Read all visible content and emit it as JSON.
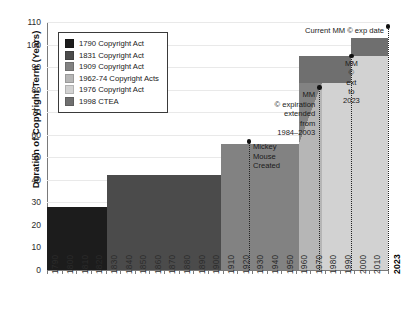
{
  "chart_data": {
    "type": "bar",
    "title": "",
    "xlabel": "",
    "ylabel": "Duration of Copyright Term (Years)",
    "ylim": [
      0,
      110
    ],
    "xlim": [
      1790,
      2023
    ],
    "grid": true,
    "legend_position": "upper-left",
    "ytick_labels": [
      "0",
      "10",
      "20",
      "30",
      "40",
      "50",
      "60",
      "70",
      "80",
      "90",
      "100",
      "110"
    ],
    "ytick_values": [
      0,
      10,
      20,
      30,
      40,
      50,
      60,
      70,
      80,
      90,
      100,
      110
    ],
    "xtick_labels": [
      "1790",
      "1800",
      "1810",
      "1820",
      "1830",
      "1840",
      "1850",
      "1860",
      "1870",
      "1880",
      "1890",
      "1900",
      "1910",
      "1920",
      "1930",
      "1940",
      "1950",
      "1960",
      "1970",
      "1980",
      "1990",
      "2000",
      "2010",
      "2023"
    ],
    "xtick_values": [
      1790,
      1800,
      1810,
      1820,
      1830,
      1840,
      1850,
      1860,
      1870,
      1880,
      1890,
      1900,
      1910,
      1920,
      1930,
      1940,
      1950,
      1960,
      1970,
      1980,
      1990,
      2000,
      2010,
      2023
    ],
    "series": [
      {
        "name": "1790 Copyright Act",
        "color": "#1c1c1c",
        "x_start": 1790,
        "x_end": 1831,
        "value": 28
      },
      {
        "name": "1831 Copyright Act",
        "color": "#4b4b4b",
        "x_start": 1831,
        "x_end": 1909,
        "value": 42
      },
      {
        "name": "1909 Copyright Act",
        "color": "#828282",
        "x_start": 1909,
        "x_end": 1962,
        "value": 56
      },
      {
        "name": "1962-74 Copyright Acts",
        "color": "#b6b6b6",
        "x_start": 1962,
        "x_end": 1978,
        "value": 83
      },
      {
        "name": "1976 Copyright Act",
        "color": "#d2d2d2",
        "x_start": 1978,
        "x_end": 2023,
        "value": 75
      },
      {
        "name": "1998 CTEA",
        "color": "#6f6f6f",
        "x_start": 1978,
        "x_end": 2023,
        "value": 95
      }
    ],
    "annotations": [
      {
        "name": "mickey-mouse-created",
        "text": "Mickey\nMouse\nCreated",
        "x": 1928,
        "y": 57
      },
      {
        "name": "mm-expiration-extended",
        "text": "MM\n© expiration\nextended\nfrom\n1984–2003",
        "x": 1976,
        "y": 81
      },
      {
        "name": "mm-ext-to-2023",
        "text": "MM\n©\next\nto\n2023",
        "x": 1998,
        "y": 95
      },
      {
        "name": "current-mm-exp-date",
        "text": "Current MM © exp date",
        "x": 2023,
        "y": 108
      }
    ]
  },
  "legend": {
    "items": [
      {
        "label": "1790 Copyright Act",
        "color": "#1c1c1c"
      },
      {
        "label": "1831 Copyright Act",
        "color": "#4b4b4b"
      },
      {
        "label": "1909 Copyright Act",
        "color": "#828282"
      },
      {
        "label": "1962-74 Copyright Acts",
        "color": "#b6b6b6"
      },
      {
        "label": "1976 Copyright Act",
        "color": "#d2d2d2"
      },
      {
        "label": "1998 CTEA",
        "color": "#6f6f6f"
      }
    ]
  },
  "axes": {
    "y_title": "Duration of Copyright Term (Years)"
  }
}
